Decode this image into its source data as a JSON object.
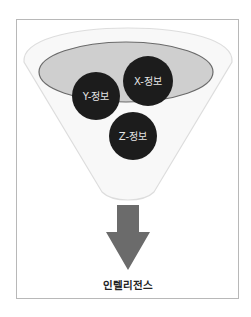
{
  "diagram": {
    "type": "funnel",
    "circles": [
      {
        "id": "x",
        "label": "X-정보",
        "cx": 148,
        "cy": 81,
        "r": 25
      },
      {
        "id": "y",
        "label": "Y-정보",
        "cx": 96,
        "cy": 96,
        "r": 24
      },
      {
        "id": "z",
        "label": "Z-정보",
        "cx": 133,
        "cy": 136,
        "r": 24
      }
    ],
    "output_label": "인텔리전스",
    "colors": {
      "frame_border": "#b8b8b8",
      "funnel_fill": "#f8f8f8",
      "funnel_border": "#dddddd",
      "ellipse_fill": "#cfcfcf",
      "ellipse_border": "#6a6a6a",
      "circle_fill": "#1c1c1c",
      "circle_text": "#e6e6e6",
      "arrow_fill": "#6b6b6b",
      "output_text": "#222222"
    }
  }
}
